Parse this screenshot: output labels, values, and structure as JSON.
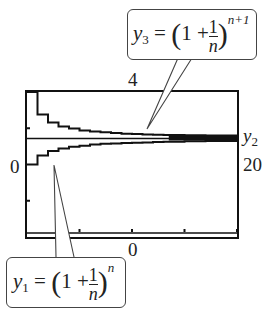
{
  "chart_data": {
    "type": "line",
    "title": "",
    "xlabel": "",
    "ylabel": "",
    "xlim": [
      0,
      20
    ],
    "ylim": [
      0,
      4
    ],
    "grid": false,
    "window_labels": {
      "ymax": "4",
      "ymin": "0",
      "xmin": "0",
      "xmax": "20"
    },
    "series": [
      {
        "name": "y1",
        "formula": "y1 = (1 + 1/n)^n",
        "x": [
          1,
          2,
          3,
          4,
          5,
          6,
          7,
          8,
          9,
          10,
          11,
          12,
          13,
          14,
          15,
          16,
          17,
          18,
          19,
          20
        ],
        "values": [
          2.0,
          2.25,
          2.37,
          2.44,
          2.49,
          2.52,
          2.55,
          2.57,
          2.58,
          2.59,
          2.6,
          2.61,
          2.62,
          2.63,
          2.63,
          2.64,
          2.64,
          2.65,
          2.65,
          2.65
        ]
      },
      {
        "name": "y2",
        "formula": "y2 = e",
        "x": [
          0,
          20
        ],
        "values": [
          2.718,
          2.718
        ]
      },
      {
        "name": "y3",
        "formula": "y3 = (1 + 1/n)^(n+1)",
        "x": [
          1,
          2,
          3,
          4,
          5,
          6,
          7,
          8,
          9,
          10,
          11,
          12,
          13,
          14,
          15,
          16,
          17,
          18,
          19,
          20
        ],
        "values": [
          4.0,
          3.38,
          3.16,
          3.05,
          2.99,
          2.94,
          2.91,
          2.89,
          2.87,
          2.85,
          2.84,
          2.83,
          2.82,
          2.81,
          2.81,
          2.8,
          2.8,
          2.79,
          2.79,
          2.79
        ]
      }
    ]
  },
  "labels": {
    "ymax": "4",
    "ymin": "0",
    "xmin": "0",
    "xmax": "20",
    "y2": "y",
    "y2_sub": "2"
  },
  "callouts": {
    "y3": {
      "var": "y",
      "sub": "3",
      "eq": "=",
      "one": "1",
      "plus": "+",
      "num": "1",
      "den": "n",
      "exp": "n+1"
    },
    "y1": {
      "var": "y",
      "sub": "1",
      "eq": "=",
      "one": "1",
      "plus": "+",
      "num": "1",
      "den": "n",
      "exp": "n"
    }
  }
}
